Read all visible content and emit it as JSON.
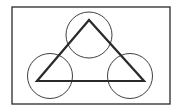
{
  "diagram": {
    "type": "geometric-figure",
    "background": "#ffffff",
    "stroke_color": "#2a2a2a",
    "frame": {
      "x": 12,
      "y": 7,
      "width": 158,
      "height": 97,
      "stroke_width": 1.3
    },
    "triangle": {
      "points": [
        [
          89,
          20
        ],
        [
          37,
          81
        ],
        [
          144,
          81
        ]
      ],
      "stroke_width": 2.2
    },
    "circles": [
      {
        "name": "top-circle",
        "cx": 89,
        "cy": 35,
        "r": 23
      },
      {
        "name": "bottom-left-circle",
        "cx": 50,
        "cy": 76,
        "r": 22.5
      },
      {
        "name": "bottom-right-circle",
        "cx": 130,
        "cy": 76,
        "r": 22.5
      }
    ],
    "circle_stroke_width": 0.9
  }
}
